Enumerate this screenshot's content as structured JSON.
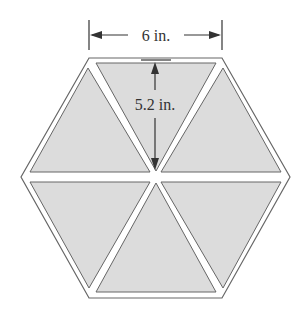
{
  "diagram": {
    "shape": "regular hexagon composed of 6 equilateral triangles",
    "triangle_count": 6,
    "side_label": "6 in.",
    "height_label": "5.2 in.",
    "colors": {
      "fill": "#dcdcdc",
      "outline": "#555555",
      "gap": "#ffffff",
      "text": "#333333"
    }
  }
}
